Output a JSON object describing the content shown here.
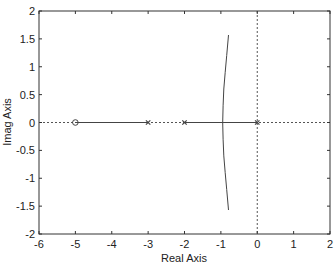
{
  "chart_data": {
    "type": "line",
    "title": "",
    "subtitle": "",
    "xlabel": "Real Axis",
    "ylabel": "Imag Axis",
    "xlim": [
      -6,
      2
    ],
    "ylim": [
      -2,
      2
    ],
    "xticks": [
      -6,
      -5,
      -4,
      -3,
      -2,
      -1,
      0,
      1,
      2
    ],
    "yticks": [
      -2,
      -1.5,
      -1,
      -0.5,
      0,
      0.5,
      1,
      1.5,
      2
    ],
    "xtick_labels": [
      "-6",
      "-5",
      "-4",
      "-3",
      "-2",
      "-1",
      "0",
      "1",
      "2"
    ],
    "ytick_labels": [
      "-2",
      "-1.5",
      "-1",
      "-0.5",
      "0",
      "0.5",
      "1",
      "1.5",
      "2"
    ],
    "grid": false,
    "legend": null,
    "reference_lines": [
      {
        "orientation": "horizontal",
        "value": 0,
        "style": "dotted"
      },
      {
        "orientation": "vertical",
        "value": 0,
        "style": "dotted"
      }
    ],
    "zeros": [
      {
        "re": -5,
        "im": 0,
        "marker": "o"
      }
    ],
    "poles": [
      {
        "re": -3,
        "im": 0,
        "marker": "x"
      },
      {
        "re": -2,
        "im": 0,
        "marker": "x"
      },
      {
        "re": 0,
        "im": 0,
        "marker": "x"
      }
    ],
    "series": [
      {
        "name": "real-axis-branch-1",
        "points": [
          [
            -5,
            0
          ],
          [
            -3,
            0
          ]
        ]
      },
      {
        "name": "real-axis-branch-2",
        "points": [
          [
            -2,
            0
          ],
          [
            0,
            0
          ]
        ]
      },
      {
        "name": "upper-branch",
        "points": [
          [
            -0.95,
            0
          ],
          [
            -0.94,
            0.3
          ],
          [
            -0.92,
            0.6
          ],
          [
            -0.88,
            0.9
          ],
          [
            -0.84,
            1.2
          ],
          [
            -0.79,
            1.57
          ]
        ]
      },
      {
        "name": "lower-branch",
        "points": [
          [
            -0.95,
            0
          ],
          [
            -0.94,
            -0.3
          ],
          [
            -0.92,
            -0.6
          ],
          [
            -0.88,
            -0.9
          ],
          [
            -0.84,
            -1.2
          ],
          [
            -0.79,
            -1.57
          ]
        ]
      }
    ]
  }
}
